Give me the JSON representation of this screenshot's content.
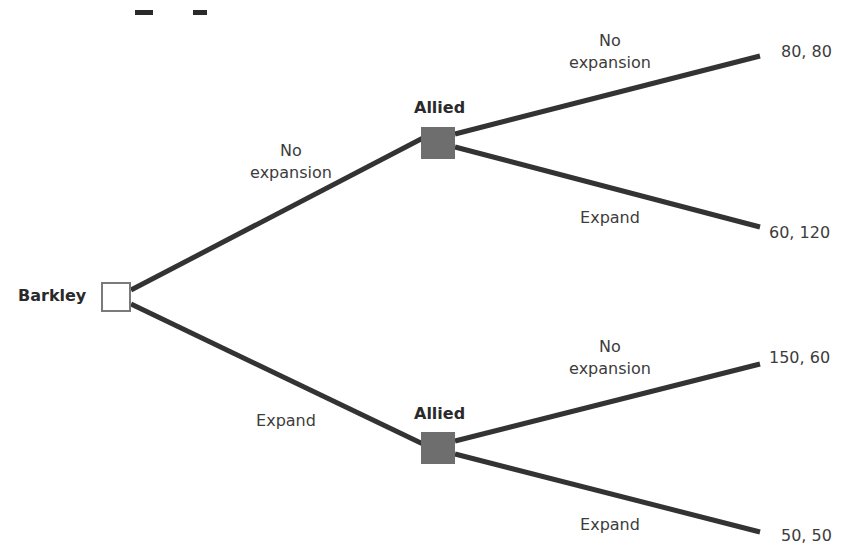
{
  "diagram": {
    "type": "game-tree",
    "root": {
      "player": "Barkley",
      "node_style": "decision-open-square"
    },
    "branches": [
      {
        "action": "No expansion",
        "action_lines": [
          "No",
          "expansion"
        ],
        "node": {
          "player": "Allied",
          "node_style": "decision-filled-square"
        },
        "children": [
          {
            "action": "No expansion",
            "action_lines": [
              "No",
              "expansion"
            ],
            "payoff": "80, 80"
          },
          {
            "action": "Expand",
            "payoff": "60, 120"
          }
        ]
      },
      {
        "action": "Expand",
        "node": {
          "player": "Allied",
          "node_style": "decision-filled-square"
        },
        "children": [
          {
            "action": "No expansion",
            "action_lines": [
              "No",
              "expansion"
            ],
            "payoff": "150, 60"
          },
          {
            "action": "Expand",
            "payoff": "50, 50"
          }
        ]
      }
    ],
    "colors": {
      "edge": "#333333",
      "allied_node": "#6e6e6e",
      "root_node_border": "#7a7a7a",
      "text": "#3c3c3c"
    }
  }
}
